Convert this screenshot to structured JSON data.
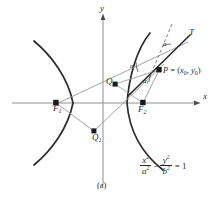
{
  "figure": {
    "caption": "(a)",
    "type": "hyperbola-reflection-property-diagram",
    "axes": {
      "x_label": "x",
      "y_label": "y",
      "origin": [
        103,
        103
      ]
    },
    "equation": {
      "x_num": "x",
      "x_num_exp": "2",
      "x_den": "a",
      "x_den_exp": "2",
      "operator": "−",
      "y_num": "y",
      "y_num_exp": "2",
      "y_den": "b",
      "y_den_exp": "2",
      "equals": "= 1"
    },
    "points": [
      {
        "id": "F1",
        "letter": "F",
        "subscript": "1",
        "label": "F₁",
        "x": 56,
        "y": 103
      },
      {
        "id": "F2",
        "letter": "F",
        "subscript": "2",
        "label": "F₂",
        "x": 143,
        "y": 103
      },
      {
        "id": "Q1",
        "letter": "Q",
        "subscript": "1",
        "label": "Q₁",
        "x": 94,
        "y": 131
      },
      {
        "id": "Q2",
        "letter": "Q",
        "subscript": "2",
        "label": "Q₂",
        "x": 115,
        "y": 84
      },
      {
        "id": "P",
        "letter": "P",
        "subscript": "",
        "label": "P = (x₀, y₀)",
        "x": 159,
        "y": 70
      }
    ],
    "point_label_P": {
      "name": "P",
      "equals": " = (",
      "x0_letter": "x",
      "x0_sub": "0",
      "comma": ", ",
      "y0_letter": "y",
      "y0_sub": "0",
      "close": ")"
    },
    "tangent_label": "T",
    "angles": [
      {
        "id": "alpha-1",
        "label": "α",
        "at": "tangent-line-above-P"
      },
      {
        "id": "alpha-2",
        "label": "α",
        "at": "between-F1P-and-tangent"
      },
      {
        "id": "alpha-3",
        "label": "α",
        "at": "between-tangent-and-F2P"
      }
    ],
    "colors": {
      "curve": "#2b2b2b",
      "axis": "#8a8a8a",
      "ray": "#8a8a8a",
      "tangent": "#2b2b2b",
      "dashed": "#6e6e6e",
      "text": "#2b2b2b",
      "background": "#ffffff"
    },
    "curve_description": {
      "left_branch_vertex": [
        73,
        103
      ],
      "right_branch_vertex": [
        127,
        103
      ],
      "semi_transverse_a": 30,
      "focal_distance_c": 47
    }
  }
}
